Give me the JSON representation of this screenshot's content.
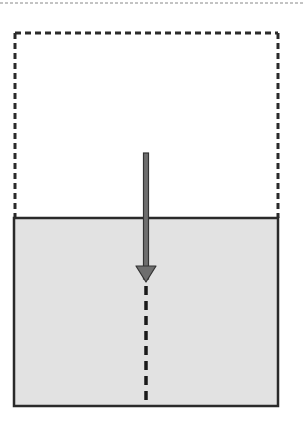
{
  "diagram": {
    "colors": {
      "background": "#ffffff",
      "fluid_fill": "#e2e2e2",
      "outline": "#2a2a2a",
      "arrow_fill": "#6e6e6e",
      "arrow_stroke": "#333333",
      "top_rule": "#888888"
    },
    "elements": {
      "top_rule": "dashed-separator",
      "dashed_box": "original-volume-outline",
      "fluid_container": "fluid-container",
      "arrow": "downward-arrow",
      "dashed_line": "trajectory-continuation"
    }
  }
}
